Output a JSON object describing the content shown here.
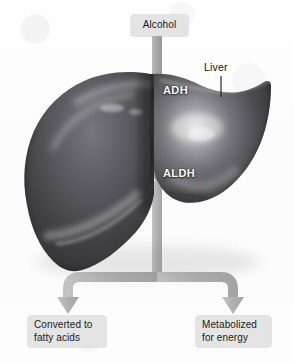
{
  "diagram": {
    "background_color": "#fdfdfd",
    "arrow_color": "#a8a8a8",
    "box_fill": "#e4e4e4",
    "enzyme_text_color": "#ffffff",
    "organ_dark": "#2f2f31",
    "organ_mid": "#55555a",
    "organ_light": "#9a9a9e"
  },
  "input": {
    "label": "Alcohol"
  },
  "organ": {
    "callout_label": "Liver",
    "name": "liver-illustration"
  },
  "enzymes": [
    {
      "label": "ADH",
      "name": "adh-label"
    },
    {
      "label": "ALDH",
      "name": "aldh-label"
    }
  ],
  "outputs": [
    {
      "label": "Converted to fatty acids",
      "line1": "Converted to",
      "line2": "fatty acids"
    },
    {
      "label": "Metabolized for energy",
      "line1": "Metabolized",
      "line2": "for energy"
    }
  ]
}
